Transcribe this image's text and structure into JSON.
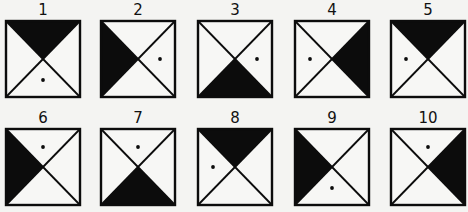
{
  "figure": {
    "colors": {
      "fill": "#0c0c0c",
      "line": "#0c0c0c",
      "background": "#f4f4f2",
      "paper": "#f7f7f5"
    },
    "items": [
      {
        "label": "1",
        "shaded": "top",
        "dot": "bottom",
        "x": 5,
        "y": 2
      },
      {
        "label": "2",
        "shaded": "left",
        "dot": "right",
        "x": 100,
        "y": 2
      },
      {
        "label": "3",
        "shaded": "bottom",
        "dot": "right",
        "x": 197,
        "y": 2
      },
      {
        "label": "4",
        "shaded": "right",
        "dot": "left",
        "x": 294,
        "y": 2
      },
      {
        "label": "5",
        "shaded": "top",
        "dot": "left",
        "x": 390,
        "y": 2
      },
      {
        "label": "6",
        "shaded": "left",
        "dot": "top",
        "x": 5,
        "y": 110
      },
      {
        "label": "7",
        "shaded": "bottom",
        "dot": "top",
        "x": 100,
        "y": 110
      },
      {
        "label": "8",
        "shaded": "top",
        "dot": "left",
        "x": 197,
        "y": 110
      },
      {
        "label": "9",
        "shaded": "left",
        "dot": "bottom",
        "x": 294,
        "y": 110
      },
      {
        "label": "10",
        "shaded": "right",
        "dot": "top",
        "x": 390,
        "y": 110
      }
    ]
  }
}
